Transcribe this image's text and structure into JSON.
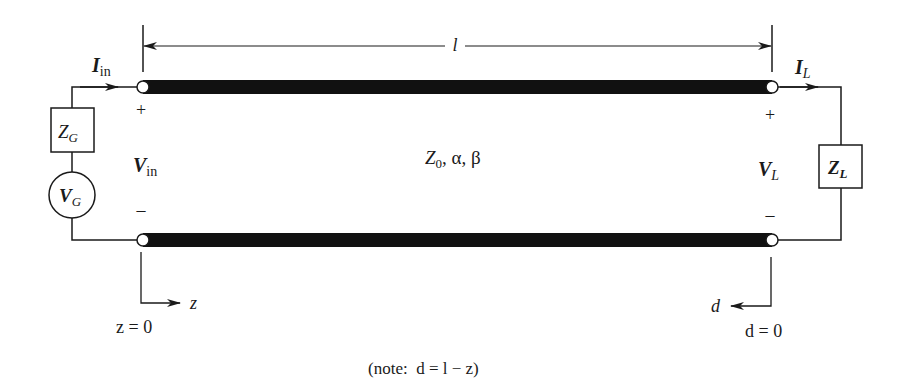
{
  "diagram": {
    "type": "transmission-line-circuit",
    "length_label": "l",
    "line_params": "Z0, α, β",
    "line_params_parts": {
      "z": "Z",
      "sub": "0",
      "rest": ", α, β"
    },
    "source": {
      "current": {
        "main": "I",
        "sub": "in"
      },
      "voltage": {
        "main": "V",
        "sub": "in"
      },
      "impedance": {
        "main": "Z",
        "sub": "G"
      },
      "generator": {
        "main": "V",
        "sub": "G"
      },
      "plus": "+",
      "minus": "–"
    },
    "load": {
      "current": {
        "main": "I",
        "sub": "L"
      },
      "voltage": {
        "main": "V",
        "sub": "L"
      },
      "impedance": {
        "main": "Z",
        "sub": "L"
      },
      "plus": "+",
      "minus": "–"
    },
    "axes": {
      "z_axis_label": "z",
      "z_origin_label": "z = 0",
      "d_axis_label": "d",
      "d_origin_label": "d = 0"
    },
    "note": "(note:  d = l − z)",
    "colors": {
      "ink": "#1a1a1a",
      "background": "#ffffff"
    }
  }
}
